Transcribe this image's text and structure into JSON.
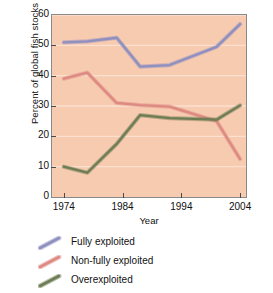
{
  "chart_data": {
    "type": "line",
    "title": "",
    "xlabel": "Year",
    "ylabel": "Percent of global fish stocks",
    "xlim": [
      1972,
      2005
    ],
    "ylim": [
      0,
      60
    ],
    "xticks": [
      1974,
      1984,
      1994,
      2004
    ],
    "yticks": [
      0,
      10,
      20,
      30,
      40,
      50,
      60
    ],
    "grid": "horizontal",
    "legend_position": "below",
    "x": [
      1974,
      1978,
      1983,
      1987,
      1992,
      2000,
      2004
    ],
    "series": [
      {
        "name": "Fully exploited",
        "color": "#8f8fc0",
        "values": [
          51,
          51.3,
          52.5,
          43,
          43.5,
          49.5,
          57
        ]
      },
      {
        "name": "Non-fully exploited",
        "color": "#dd8a82",
        "values": [
          39,
          41,
          31,
          30.3,
          29.8,
          25,
          12.5
        ]
      },
      {
        "name": "Overexploited",
        "color": "#6f7d55",
        "values": [
          10,
          8,
          17.5,
          27,
          26,
          25.5,
          30.2
        ]
      }
    ]
  },
  "axes": {
    "ylabel": "Percent of global fish stocks",
    "xlabel": "Year",
    "ytick_labels": [
      "0",
      "10",
      "20",
      "30",
      "40",
      "50",
      "60"
    ],
    "xtick_labels": [
      "1974",
      "1984",
      "1994",
      "2004"
    ]
  },
  "legend": {
    "items": [
      {
        "label": "Fully exploited",
        "color": "#8f8fc0"
      },
      {
        "label": "Non-fully exploited",
        "color": "#dd8a82"
      },
      {
        "label": "Overexploited",
        "color": "#6f7d55"
      }
    ]
  },
  "colors": {
    "plot_background": "#f7cbb0",
    "gridline": "#fbe0d0",
    "frame": "#8a8a8a",
    "text": "#111111"
  }
}
